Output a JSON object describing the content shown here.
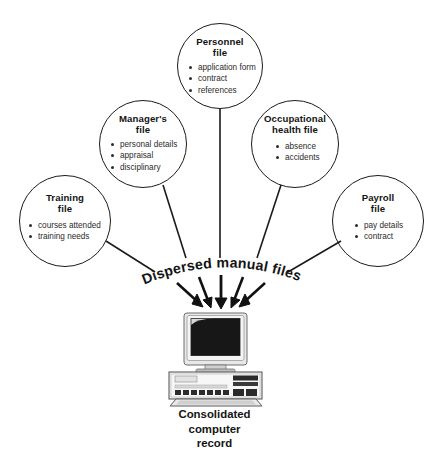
{
  "diagram": {
    "type": "radial-convergence-diagram",
    "center_label": "Dispersed manual files",
    "caption_lines": [
      "Consolidated",
      "computer",
      "record"
    ],
    "caption_full": "Consolidated computer record",
    "arrow_count": 5,
    "connector_count": 5,
    "icon_label": "desktop-computer",
    "colors": {
      "stroke": "#1b1b1b",
      "title_text": "#141414",
      "item_text": "#2b2b2b",
      "background": "#ffffff"
    },
    "nodes": [
      {
        "id": "personnel",
        "title_lines": [
          "Personnel",
          "file"
        ],
        "title": "Personnel file",
        "items": [
          "application form",
          "contract",
          "references"
        ]
      },
      {
        "id": "managers",
        "title_lines": [
          "Manager's",
          "file"
        ],
        "title": "Manager's file",
        "items": [
          "personal details",
          "appraisal",
          "disciplinary"
        ]
      },
      {
        "id": "occupational-health",
        "title_lines": [
          "Occupational",
          "health file"
        ],
        "title": "Occupational health file",
        "items": [
          "absence",
          "accidents"
        ]
      },
      {
        "id": "training",
        "title_lines": [
          "Training",
          "file"
        ],
        "title": "Training file",
        "items": [
          "courses attended",
          "training needs"
        ]
      },
      {
        "id": "payroll",
        "title_lines": [
          "Payroll",
          "file"
        ],
        "title": "Payroll file",
        "items": [
          "pay details",
          "contract"
        ]
      }
    ]
  }
}
